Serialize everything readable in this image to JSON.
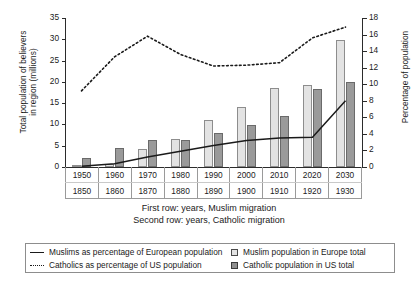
{
  "chart_data": {
    "type": "bar",
    "title": "",
    "categories": [
      "1950",
      "1960",
      "1970",
      "1980",
      "1990",
      "2000",
      "2010",
      "2020",
      "2030"
    ],
    "categories_second_row": [
      "1850",
      "1860",
      "1870",
      "1880",
      "1890",
      "1900",
      "1910",
      "1920",
      "1930"
    ],
    "xlabel": "First row: years, Muslim migration\nSecond row: years, Catholic migration",
    "ylabel": "Total population of believers in region (millions)",
    "y2label": "Percentage of population",
    "ylim": [
      0,
      35
    ],
    "y2lim": [
      0,
      18
    ],
    "yticks": [
      0,
      5,
      10,
      15,
      20,
      25,
      30,
      35
    ],
    "y2ticks": [
      0,
      2,
      4,
      6,
      8,
      10,
      12,
      14,
      16,
      18
    ],
    "grid": false,
    "legend_position": "below-plot",
    "series": [
      {
        "name": "Muslim population in Europe total",
        "type": "bar",
        "axis": "left",
        "unit": "millions",
        "color": "#e3e3e3",
        "values": [
          0.2,
          0.7,
          4.3,
          6.6,
          11.0,
          14.0,
          18.6,
          19.3,
          29.8
        ]
      },
      {
        "name": "Catholic population in US total",
        "type": "bar",
        "axis": "left",
        "unit": "millions",
        "color": "#9a9a9a",
        "values": [
          2.1,
          4.5,
          6.4,
          6.3,
          8.0,
          9.8,
          12.0,
          18.4,
          20.0
        ]
      },
      {
        "name": "Muslims as percentage of European population",
        "type": "line",
        "style": "solid",
        "axis": "right",
        "unit": "percent",
        "color": "#1a1a1a",
        "values": [
          0.1,
          0.4,
          1.2,
          1.9,
          2.6,
          3.2,
          3.5,
          3.6,
          8.0
        ]
      },
      {
        "name": "Catholics as percentage of US population",
        "type": "line",
        "style": "dotted",
        "axis": "right",
        "unit": "percent",
        "color": "#1a1a1a",
        "values": [
          9.2,
          13.3,
          15.8,
          13.6,
          12.2,
          12.3,
          12.6,
          15.6,
          16.9
        ]
      }
    ],
    "legend_entries": [
      {
        "label": "Muslims as percentage of European population",
        "marker": "solid-line"
      },
      {
        "label": "Muslim population in Europe total",
        "marker": "light-box"
      },
      {
        "label": "Catholics as percentage of US population",
        "marker": "dotted-line"
      },
      {
        "label": "Catholic population in US total",
        "marker": "dark-box"
      }
    ]
  },
  "axes": {
    "left_title": "Total population of believers\nin region (millions)",
    "right_title": "Percentage of population",
    "left_ticks": [
      "35",
      "30",
      "25",
      "20",
      "15",
      "10",
      "5",
      "0"
    ],
    "right_ticks": [
      "18",
      "16",
      "14",
      "12",
      "10",
      "8",
      "6",
      "4",
      "2",
      "0"
    ]
  },
  "x_axis": {
    "row1": [
      "1950",
      "1960",
      "1970",
      "1980",
      "1990",
      "2000",
      "2010",
      "2020",
      "2030"
    ],
    "row2": [
      "1850",
      "1860",
      "1870",
      "1880",
      "1890",
      "1900",
      "1910",
      "1920",
      "1930"
    ],
    "caption_line1": "First row: years, Muslim migration",
    "caption_line2": "Second row: years, Catholic migration"
  },
  "legend": {
    "row1_left": "Muslims as percentage of European population",
    "row1_right": "Muslim population in Europe total",
    "row2_left": "Catholics as percentage of US population",
    "row2_right": "Catholic population in US total"
  },
  "bottom_cut_text": ""
}
